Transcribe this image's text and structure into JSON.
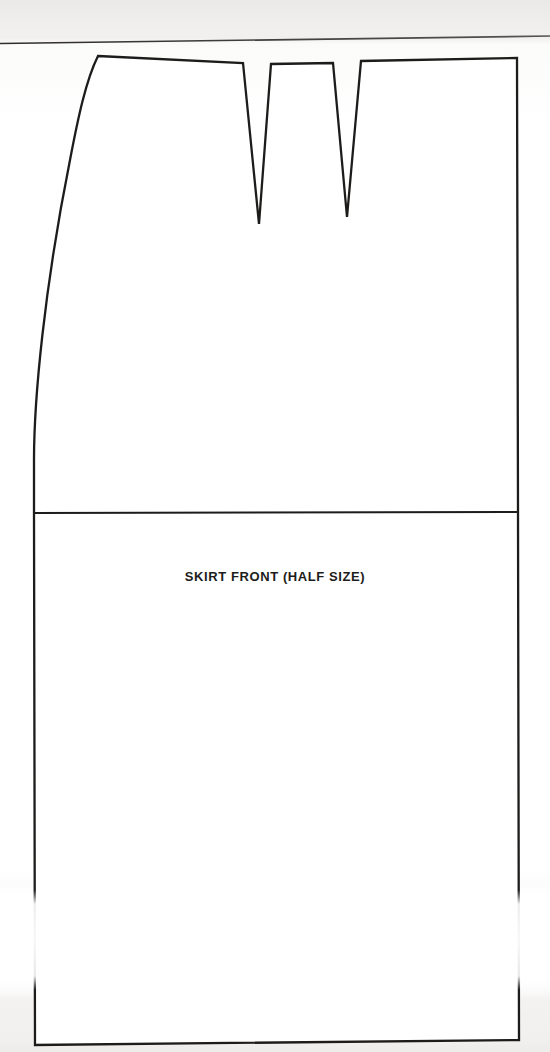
{
  "page": {
    "width": 550,
    "height": 1052,
    "background_color": "#ffffff",
    "paper_tint": "#f1efed",
    "ink_color": "#1d1c1b"
  },
  "diagram": {
    "type": "sewing-pattern-piece",
    "title": "SKIRT FRONT (HALF SIZE)",
    "label_text": "SKIRT FRONT (HALF SIZE)",
    "stroke_color": "#1d1c1b",
    "stroke_width": 2.2,
    "fill_color": "#ffffff",
    "outline_points": "98,56 243,63 259,224 271,64 333,63 347,217 361,61 517,58 517,1040 35,1045 34,460 40,360 56,240 75,140",
    "features": [
      {
        "name": "waistline",
        "description": "slightly sloped top edge from waist corner to center-front",
        "from": [
          98,
          56
        ],
        "to": [
          517,
          58
        ]
      },
      {
        "name": "side-seam",
        "description": "curved left edge from waist corner down to hip, then straight",
        "from": [
          98,
          56
        ],
        "to": [
          34,
          460
        ]
      },
      {
        "name": "center-front",
        "description": "straight right edge (fold line)",
        "from": [
          517,
          58
        ],
        "to": [
          519,
          1040
        ]
      },
      {
        "name": "hem",
        "description": "bottom edge, slight upward slope to the right",
        "from": [
          35,
          1045
        ],
        "to": [
          519,
          1040
        ]
      },
      {
        "name": "hipline",
        "description": "horizontal guide line across the piece",
        "from": [
          34,
          513
        ],
        "to": [
          519,
          512
        ]
      },
      {
        "name": "dart-1",
        "description": "first waist dart (nearer side seam)",
        "left": [
          243,
          63
        ],
        "right": [
          271,
          64
        ],
        "tip": [
          259,
          224
        ],
        "width": 28,
        "length": 161
      },
      {
        "name": "dart-2",
        "description": "second waist dart (nearer center front)",
        "left": [
          333,
          63
        ],
        "right": [
          361,
          61
        ],
        "tip": [
          347,
          217
        ],
        "width": 28,
        "length": 155
      }
    ],
    "page_edge_line": {
      "name": "page-edge",
      "description": "faint sloping scan line across the full width near the top",
      "from": [
        0,
        43
      ],
      "to": [
        550,
        36
      ]
    }
  }
}
